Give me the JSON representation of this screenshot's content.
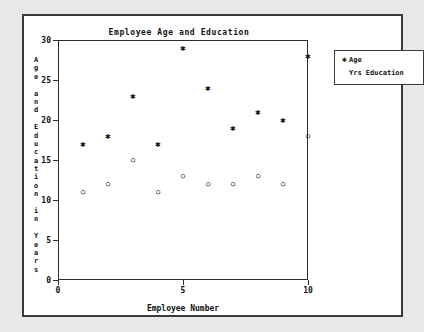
{
  "chart_data": {
    "type": "scatter",
    "title": "Employee Age and Education",
    "xlabel": "Employee Number",
    "ylabel": "Age and Education in Years",
    "xlim": [
      0,
      10
    ],
    "ylim": [
      0,
      30
    ],
    "xticks": [
      "0",
      "5",
      "10"
    ],
    "xtick_values": [
      0,
      5,
      10
    ],
    "yticks": [
      "0",
      "5",
      "10",
      "15",
      "20",
      "25",
      "30"
    ],
    "ytick_values": [
      0,
      5,
      10,
      15,
      20,
      25,
      30
    ],
    "grid": false,
    "legend_position": "top-right",
    "x": [
      1,
      2,
      3,
      4,
      5,
      6,
      7,
      8,
      9,
      10
    ],
    "series": [
      {
        "name": "Age",
        "marker": "*",
        "values": [
          17,
          18,
          23,
          17,
          29,
          24,
          19,
          21,
          20,
          28
        ]
      },
      {
        "name": "Yrs Education",
        "marker": "o",
        "values": [
          11,
          12,
          15,
          11,
          13,
          12,
          12,
          13,
          12,
          18
        ]
      }
    ]
  },
  "chart": {
    "title": "Employee Age and Education",
    "xlabel": "Employee Number",
    "ylabel_chars": [
      "A",
      "g",
      "e",
      "",
      "a",
      "n",
      "d",
      "",
      "E",
      "d",
      "u",
      "c",
      "a",
      "t",
      "i",
      "o",
      "n",
      "",
      "i",
      "n",
      "",
      "Y",
      "e",
      "a",
      "r",
      "s"
    ]
  },
  "legend": {
    "entries": [
      {
        "marker": "✱",
        "label": "Age"
      },
      {
        "marker": "",
        "label": "Yrs Education"
      }
    ]
  },
  "colors": {
    "background": "#e8e8e6",
    "panel": "#ffffff",
    "frame": "#3b3b3b",
    "axis": "#2e2e2e",
    "text": "#111111"
  }
}
